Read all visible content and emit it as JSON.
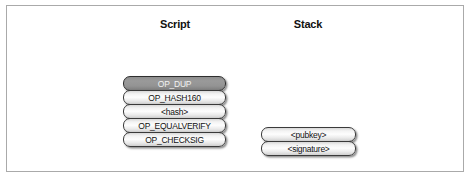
{
  "figure": {
    "columns": [
      {
        "id": "script",
        "header": "Script"
      },
      {
        "id": "stack",
        "header": "Stack"
      }
    ],
    "script_items": [
      {
        "label": "OP_DUP",
        "highlighted": true
      },
      {
        "label": "OP_HASH160",
        "highlighted": false
      },
      {
        "label": "<hash>",
        "highlighted": false
      },
      {
        "label": "OP_EQUALVERIFY",
        "highlighted": false
      },
      {
        "label": "OP_CHECKSIG",
        "highlighted": false
      }
    ],
    "stack_items": [
      {
        "label": "<pubkey>",
        "highlighted": false
      },
      {
        "label": "<signature>",
        "highlighted": false
      }
    ],
    "colors": {
      "frame_border": "#aaaaaa",
      "box_border": "#3a3a3a",
      "box_fill": "#f3f3f3",
      "highlight_fill": "#939393",
      "highlight_text": "#f2f2f2",
      "text": "#111111",
      "background": "#ffffff"
    }
  }
}
